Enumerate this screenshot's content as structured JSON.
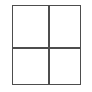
{
  "diagram": {
    "type": "grid",
    "title": "",
    "rows": 2,
    "columns": 2,
    "background_color": "#ffffff",
    "line_color": "#4d4d4d",
    "line_width_px": 1.5,
    "frame": {
      "x": 12,
      "y": 5,
      "width": 69,
      "height": 80,
      "fill_color": "#ffffff"
    },
    "dividers": {
      "vertical_x": 35,
      "horizontal_y": 41
    },
    "cells": [
      {
        "id": "top-left",
        "row": 1,
        "column": 1,
        "label": "",
        "fill_color": "#ffffff"
      },
      {
        "id": "top-right",
        "row": 1,
        "column": 2,
        "label": "",
        "fill_color": "#ffffff"
      },
      {
        "id": "bottom-left",
        "row": 2,
        "column": 1,
        "label": "",
        "fill_color": "#ffffff"
      },
      {
        "id": "bottom-right",
        "row": 2,
        "column": 2,
        "label": "",
        "fill_color": "#ffffff"
      }
    ]
  }
}
